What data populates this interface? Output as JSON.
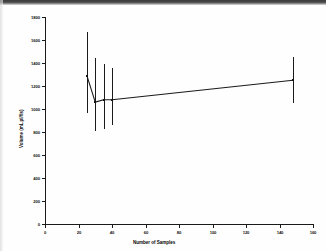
{
  "chart_data": {
    "type": "line",
    "title": "",
    "xlabel": "Number of Samples",
    "ylabel": "Volume (mL pl/fis)",
    "xlim": [
      0,
      160
    ],
    "ylim": [
      0,
      1800
    ],
    "xticks": [
      0,
      20,
      40,
      60,
      80,
      100,
      120,
      140,
      160
    ],
    "xticklabels": [
      "0",
      "20",
      "40",
      "60",
      "80",
      "100",
      "120",
      "140",
      "160"
    ],
    "yticks": [
      0,
      200,
      400,
      600,
      800,
      1000,
      1200,
      1400,
      1600,
      1800
    ],
    "yticklabels": [
      "0",
      "200",
      "400",
      "600",
      "800",
      "1000",
      "1200",
      "1400",
      "1600",
      "1800"
    ],
    "grid": false,
    "legend": false,
    "marker": "filled-square",
    "line_color": "#1a1a1a",
    "error_bar_style": "vertical-line-no-caps",
    "x": [
      25,
      30,
      35,
      40,
      148
    ],
    "values": [
      1290,
      1060,
      1080,
      1080,
      1250
    ],
    "error_low": [
      965,
      805,
      830,
      865,
      1055
    ],
    "error_high": [
      1670,
      1445,
      1395,
      1355,
      1455
    ],
    "series": [
      {
        "name": "Volume",
        "points": [
          {
            "x": 25,
            "y": 1290,
            "low": 965,
            "high": 1670
          },
          {
            "x": 30,
            "y": 1060,
            "low": 805,
            "high": 1445
          },
          {
            "x": 35,
            "y": 1080,
            "low": 830,
            "high": 1395
          },
          {
            "x": 40,
            "y": 1080,
            "low": 865,
            "high": 1355
          },
          {
            "x": 148,
            "y": 1250,
            "low": 1055,
            "high": 1455
          }
        ]
      }
    ]
  },
  "figure": {
    "background_color": "#fefefe",
    "axis_color": "#1a1a1a"
  }
}
